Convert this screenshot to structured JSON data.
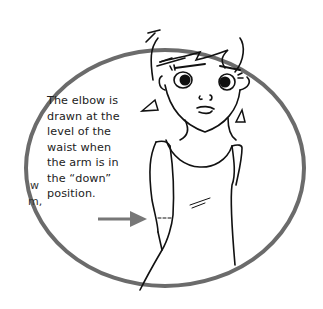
{
  "figure": {
    "caption_lines": [
      "The elbow is",
      "drawn at the",
      "level of the",
      "waist when",
      "the arm is in",
      "the “down”",
      "position."
    ],
    "side_text_fragments": [
      "w",
      "m,"
    ],
    "circle_stroke_color": "#6b6b6b",
    "arrow_color": "#777777",
    "line_color": "#111111"
  }
}
